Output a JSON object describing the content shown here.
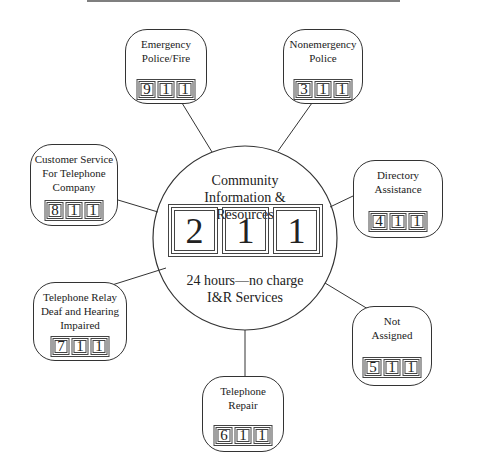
{
  "center": {
    "title": "Community\nInformation & Resources",
    "digits": [
      "2",
      "1",
      "1"
    ],
    "subtitle": "24 hours—no charge\nI&R Services"
  },
  "services": [
    {
      "id": "emergency",
      "label": "Emergency\nPolice/Fire",
      "digits": [
        "9",
        "1",
        "1"
      ]
    },
    {
      "id": "nonemergency",
      "label": "Nonemergency\nPolice",
      "digits": [
        "3",
        "1",
        "1"
      ]
    },
    {
      "id": "customer-service",
      "label": "Customer Service\nFor Telephone\nCompany",
      "digits": [
        "8",
        "1",
        "1"
      ]
    },
    {
      "id": "directory",
      "label": "Directory\nAssistance",
      "digits": [
        "4",
        "1",
        "1"
      ]
    },
    {
      "id": "relay",
      "label": "Telephone Relay\nDeaf and Hearing\nImpaired",
      "digits": [
        "7",
        "1",
        "1"
      ]
    },
    {
      "id": "not-assigned",
      "label": "Not\nAssigned",
      "digits": [
        "5",
        "1",
        "1"
      ]
    },
    {
      "id": "repair",
      "label": "Telephone\nRepair",
      "digits": [
        "6",
        "1",
        "1"
      ]
    }
  ]
}
